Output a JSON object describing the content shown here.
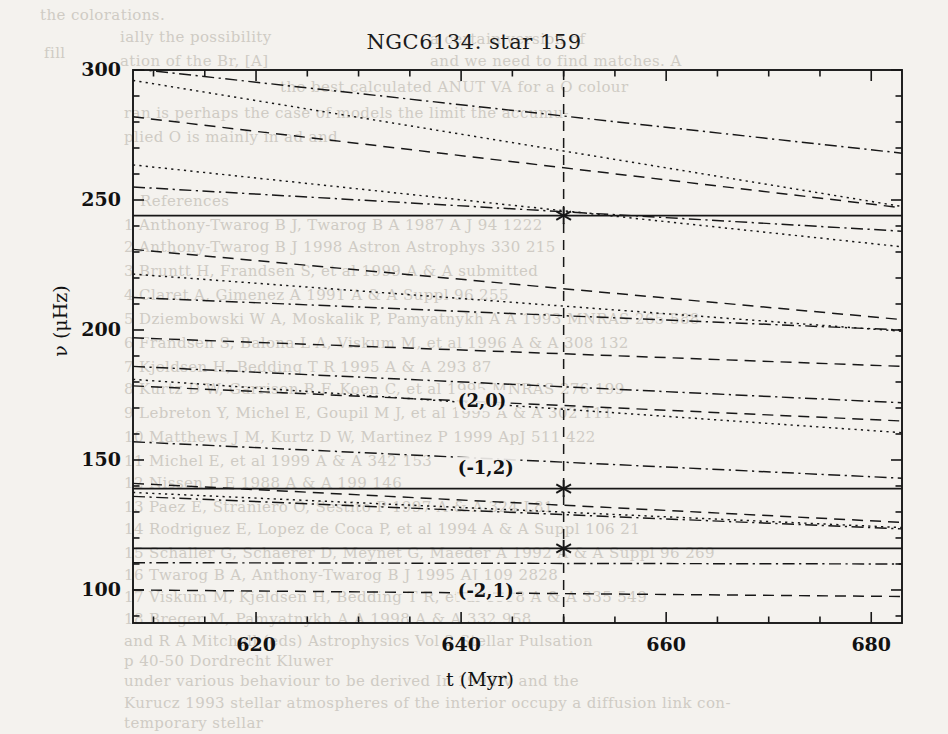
{
  "figure": {
    "title": "NGC6134. star 159",
    "x_axis_title": "t (Myr)",
    "y_axis_title": "ν (μHz)"
  },
  "chart_data": {
    "type": "line",
    "title": "NGC6134. star 159",
    "xlabel": "t (Myr)",
    "ylabel": "ν (μHz)",
    "xlim": [
      608.0,
      683.0
    ],
    "ylim": [
      87.3,
      300.0
    ],
    "xticks": [
      620,
      640,
      660,
      680
    ],
    "yticks": [
      100,
      150,
      200,
      250,
      300
    ],
    "xticks_minor_step": 5,
    "yticks_minor_step": 10,
    "grid": false,
    "legend": null,
    "annotations": [
      {
        "text": "(2,0)",
        "x": 643.0,
        "y": 172.0
      },
      {
        "text": "(-1,2)",
        "x": 643.0,
        "y": 146.0
      },
      {
        "text": "(-2,1)",
        "x": 643.0,
        "y": 99.0
      }
    ],
    "marker_line": {
      "x": 650.0,
      "style": "dashed",
      "label": "t = 650 Myr"
    },
    "observed_points": [
      {
        "x": 650.0,
        "y": 244.0,
        "marker": "asterisk"
      },
      {
        "x": 650.0,
        "y": 139.0,
        "marker": "asterisk"
      },
      {
        "x": 650.0,
        "y": 116.0,
        "marker": "asterisk"
      }
    ],
    "series": [
      {
        "name": "obs-1",
        "style": "solid",
        "x": [
          608,
          683
        ],
        "values": [
          244.0,
          244.0
        ]
      },
      {
        "name": "obs-2",
        "style": "solid",
        "x": [
          608,
          683
        ],
        "values": [
          139.0,
          139.0
        ]
      },
      {
        "name": "obs-3",
        "style": "solid",
        "x": [
          608,
          683
        ],
        "values": [
          116.0,
          116.0
        ]
      },
      {
        "name": "m01",
        "style": "dashdot",
        "x": [
          608,
          683
        ],
        "values": [
          300.5,
          268.0
        ]
      },
      {
        "name": "m02",
        "style": "dotted",
        "x": [
          608,
          683
        ],
        "values": [
          296.0,
          247.5
        ]
      },
      {
        "name": "m03",
        "style": "dashed",
        "x": [
          608,
          683
        ],
        "values": [
          282.0,
          247.0
        ]
      },
      {
        "name": "m04",
        "style": "dotted",
        "x": [
          608,
          683
        ],
        "values": [
          263.5,
          232.0
        ]
      },
      {
        "name": "m05",
        "style": "dashdot",
        "x": [
          608,
          683
        ],
        "values": [
          255.0,
          238.0
        ]
      },
      {
        "name": "m06",
        "style": "dashed",
        "x": [
          608,
          683
        ],
        "values": [
          231.0,
          204.0
        ]
      },
      {
        "name": "m07",
        "style": "dotted",
        "x": [
          608,
          683
        ],
        "values": [
          221.5,
          199.5
        ]
      },
      {
        "name": "m08",
        "style": "dashdot",
        "x": [
          608,
          683
        ],
        "values": [
          212.5,
          200.0
        ]
      },
      {
        "name": "m09",
        "style": "dashed",
        "x": [
          608,
          683
        ],
        "values": [
          197.0,
          186.0
        ]
      },
      {
        "name": "m10",
        "style": "dashdot",
        "x": [
          608,
          683
        ],
        "values": [
          186.0,
          172.0
        ]
      },
      {
        "name": "m11",
        "style": "dotted",
        "x": [
          608,
          683
        ],
        "values": [
          181.0,
          160.5
        ]
      },
      {
        "name": "m12",
        "style": "dashed",
        "x": [
          608,
          683
        ],
        "values": [
          178.5,
          165.0
        ]
      },
      {
        "name": "m13",
        "style": "dashdot",
        "x": [
          608,
          683
        ],
        "values": [
          157.0,
          143.0
        ]
      },
      {
        "name": "m14",
        "style": "dashed",
        "x": [
          608,
          683
        ],
        "values": [
          141.0,
          126.0
        ]
      },
      {
        "name": "m15",
        "style": "dotted",
        "x": [
          608,
          683
        ],
        "values": [
          137.5,
          124.0
        ]
      },
      {
        "name": "m16",
        "style": "dashdot",
        "x": [
          608,
          683
        ],
        "values": [
          136.0,
          123.5
        ]
      },
      {
        "name": "m17",
        "style": "dashdot",
        "x": [
          608,
          683
        ],
        "values": [
          110.5,
          110.0
        ]
      },
      {
        "name": "m18",
        "style": "dashed",
        "x": [
          608,
          683
        ],
        "values": [
          100.0,
          97.5
        ]
      }
    ]
  },
  "background_text": {
    "note": "faint show-through text from the reverse page of the scan",
    "lines": [
      {
        "text": "the colorations.",
        "x": 40,
        "y": 6
      },
      {
        "text": "ially the possibility",
        "x": 120,
        "y": 28
      },
      {
        "text": "ation of the Br, [A]",
        "x": 120,
        "y": 52
      },
      {
        "text": "fill",
        "x": 44,
        "y": 44
      },
      {
        "text": "a certain  version of",
        "x": 430,
        "y": 30
      },
      {
        "text": "and we need to find matches.  A",
        "x": 430,
        "y": 52
      },
      {
        "text": "the best calculated ANUT VA  for a  O  colour",
        "x": 280,
        "y": 78
      },
      {
        "text": "ran is perhaps the case of models the limit the accumu-",
        "x": 124,
        "y": 104
      },
      {
        "text": "plied O  is mainly in ad  and",
        "x": 124,
        "y": 128
      },
      {
        "text": "References",
        "x": 140,
        "y": 192
      },
      {
        "text": "1  Anthony-Twarog B J, Twarog B A  1987  A J  94  1222",
        "x": 124,
        "y": 216
      },
      {
        "text": "2  Anthony-Twarog B J  1998  Astron  Astrophys  330  215",
        "x": 124,
        "y": 238
      },
      {
        "text": "3  Bruntt H, Frandsen S, et al  1999  A & A  submitted",
        "x": 124,
        "y": 262
      },
      {
        "text": "4  Claret A, Gimenez A  1991  A & A Suppl  96  255",
        "x": 124,
        "y": 286
      },
      {
        "text": "5  Dziembowski W A, Moskalik P, Pamyatnykh A A  1993  MNRAS 265 588",
        "x": 124,
        "y": 310
      },
      {
        "text": "6  Frandsen S, Balona L A, Viskum M, et al  1996  A & A  308  132",
        "x": 124,
        "y": 334
      },
      {
        "text": "7  Kjeldsen H, Bedding T R  1995  A & A  293  87",
        "x": 124,
        "y": 358
      },
      {
        "text": "8  Kurtz D W, Garrison R F, Koen C, et al  1995  MNRAS  276  199",
        "x": 124,
        "y": 380
      },
      {
        "text": "9  Lebreton Y, Michel E, Goupil M J, et al  1995  A & A  302  111",
        "x": 124,
        "y": 404
      },
      {
        "text": "10  Matthews J M, Kurtz D W, Martinez P  1999  ApJ  511  422",
        "x": 124,
        "y": 428
      },
      {
        "text": "11  Michel E, et al  1999  A & A  342  153",
        "x": 124,
        "y": 452
      },
      {
        "text": "12  Nissen P E  1988  A & A  199  146",
        "x": 124,
        "y": 474
      },
      {
        "text": "13  Paez E, Straniero O, Sestito P  1997  A & A  324  L81",
        "x": 124,
        "y": 498
      },
      {
        "text": "14  Rodriguez E, Lopez de Coca P, et al  1994  A & A Suppl  106  21",
        "x": 124,
        "y": 520
      },
      {
        "text": "15  Schaller G, Schaerer D, Meynet G, Maeder A  1992  A & A Suppl  96  269",
        "x": 124,
        "y": 544
      },
      {
        "text": "16  Twarog B A, Anthony-Twarog B J  1995  AJ  109  2828",
        "x": 124,
        "y": 566
      },
      {
        "text": "17  Viskum M, Kjeldsen H, Bedding T R, et al  1998  A & A  335  549",
        "x": 124,
        "y": 588
      },
      {
        "text": "18  Breger M, Pamyatnykh A A  1998  A & A  332  958",
        "x": 124,
        "y": 610
      },
      {
        "text": "and R A Mitchell  (eds)  Astrophysics  Vol  2  Stellar Pulsation",
        "x": 124,
        "y": 632
      },
      {
        "text": "p 40-50  Dordrecht  Kluwer",
        "x": 124,
        "y": 652
      },
      {
        "text": "under various behaviour to be derived  In  1992  V and the",
        "x": 124,
        "y": 672
      },
      {
        "text": "Kurucz  1993  stellar atmospheres  of the interior  occupy a diffusion  link con-",
        "x": 124,
        "y": 694
      },
      {
        "text": "temporary stellar",
        "x": 124,
        "y": 714
      }
    ]
  }
}
